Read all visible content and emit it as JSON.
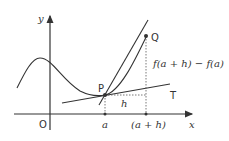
{
  "diagram": {
    "axes": {
      "x_label": "x",
      "y_label": "y",
      "origin_label": "O"
    },
    "points": {
      "P": "P",
      "Q": "Q"
    },
    "tangent_label": "T",
    "x_ticks": {
      "a": "a",
      "a_plus_h": "(a + h)"
    },
    "increment_label": "h",
    "rise_label": "f(a + h) − f(a)",
    "colors": {
      "stroke": "#333333",
      "background": "#ffffff"
    }
  }
}
